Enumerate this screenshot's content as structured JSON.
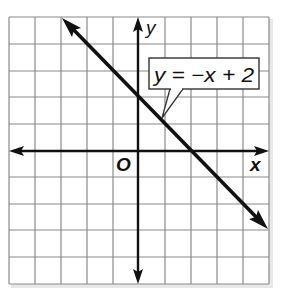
{
  "graph": {
    "axes": {
      "x_label": "x",
      "y_label": "y",
      "origin_label": "O"
    },
    "grid": {
      "columns": 10,
      "rows": 10,
      "x_range": [
        -5,
        5
      ],
      "y_range": [
        -5,
        5
      ]
    },
    "line": {
      "equation_label": "y = −x + 2",
      "slope": -1,
      "y_intercept": 2,
      "x_intercept": 2,
      "arrows": "both ends"
    },
    "colors": {
      "grid": "#8a8a8a",
      "ink": "#111111",
      "background": "#ffffff"
    }
  }
}
